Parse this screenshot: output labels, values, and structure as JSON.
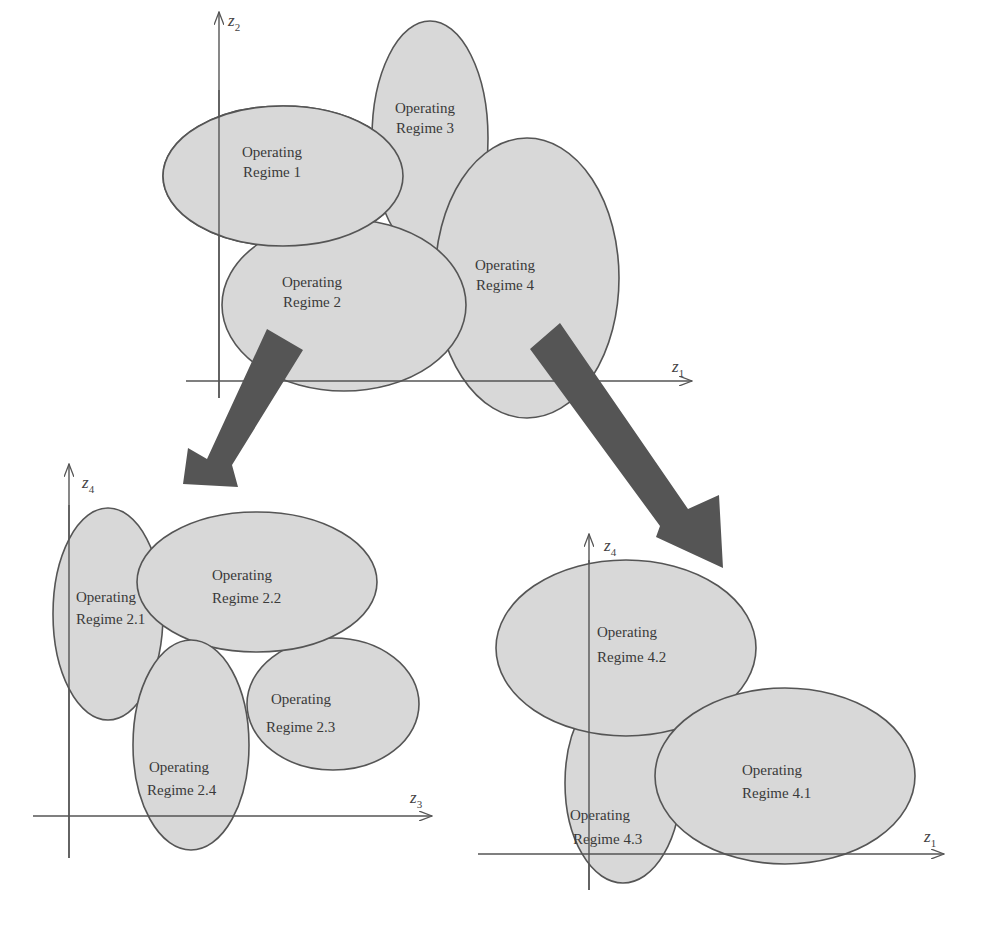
{
  "diagram": {
    "colors": {
      "region_fill": "#d8d8d8",
      "outline": "#555555",
      "arrow": "#555555",
      "text": "#3a3a3a"
    },
    "top_plot": {
      "x_axis": {
        "label": "z",
        "sub": "1"
      },
      "y_axis": {
        "label": "z",
        "sub": "2"
      },
      "regions": [
        {
          "line1": "Operating",
          "line2": "Regime 1"
        },
        {
          "line1": "Operating",
          "line2": "Regime 2"
        },
        {
          "line1": "Operating",
          "line2": "Regime 3"
        },
        {
          "line1": "Operating",
          "line2": "Regime 4"
        }
      ]
    },
    "bottom_left_plot": {
      "x_axis": {
        "label": "z",
        "sub": "3"
      },
      "y_axis": {
        "label": "z",
        "sub": "4"
      },
      "regions": [
        {
          "line1": "Operating",
          "line2": "Regime 2.1"
        },
        {
          "line1": "Operating",
          "line2": "Regime 2.2"
        },
        {
          "line1": "Operating",
          "line2": "Regime 2.3"
        },
        {
          "line1": "Operating",
          "line2": "Regime 2.4"
        }
      ]
    },
    "bottom_right_plot": {
      "x_axis": {
        "label": "z",
        "sub": "1"
      },
      "y_axis": {
        "label": "z",
        "sub": "4"
      },
      "regions": [
        {
          "line1": "Operating",
          "line2": "Regime 4.1"
        },
        {
          "line1": "Operating",
          "line2": "Regime 4.2"
        },
        {
          "line1": "Operating",
          "line2": "Regime 4.3"
        }
      ]
    },
    "arrows": [
      {
        "from": "Regime 2",
        "to": "bottom_left_plot"
      },
      {
        "from": "Regime 4",
        "to": "bottom_right_plot"
      }
    ]
  }
}
